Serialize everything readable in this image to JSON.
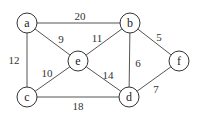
{
  "graph": {
    "nodes": [
      {
        "id": "a",
        "label": "a",
        "x": 27,
        "y": 23
      },
      {
        "id": "b",
        "label": "b",
        "x": 130,
        "y": 23
      },
      {
        "id": "e",
        "label": "e",
        "x": 78,
        "y": 61
      },
      {
        "id": "f",
        "label": "f",
        "x": 179,
        "y": 61
      },
      {
        "id": "c",
        "label": "c",
        "x": 27,
        "y": 97
      },
      {
        "id": "d",
        "label": "d",
        "x": 129,
        "y": 97
      }
    ],
    "edges": [
      {
        "from": "a",
        "to": "b",
        "weight": "20",
        "lx": 80,
        "ly": 16
      },
      {
        "from": "a",
        "to": "e",
        "weight": "9",
        "lx": 61,
        "ly": 39
      },
      {
        "from": "a",
        "to": "c",
        "weight": "12",
        "lx": 14,
        "ly": 60
      },
      {
        "from": "b",
        "to": "e",
        "weight": "11",
        "lx": 97,
        "ly": 38
      },
      {
        "from": "b",
        "to": "d",
        "weight": "6",
        "lx": 138,
        "ly": 63
      },
      {
        "from": "b",
        "to": "f",
        "weight": "5",
        "lx": 159,
        "ly": 37
      },
      {
        "from": "e",
        "to": "c",
        "weight": "10",
        "lx": 47,
        "ly": 73
      },
      {
        "from": "e",
        "to": "d",
        "weight": "14",
        "lx": 108,
        "ly": 75
      },
      {
        "from": "c",
        "to": "d",
        "weight": "18",
        "lx": 78,
        "ly": 106
      },
      {
        "from": "d",
        "to": "f",
        "weight": "7",
        "lx": 156,
        "ly": 89
      }
    ],
    "node_radius": 10
  }
}
